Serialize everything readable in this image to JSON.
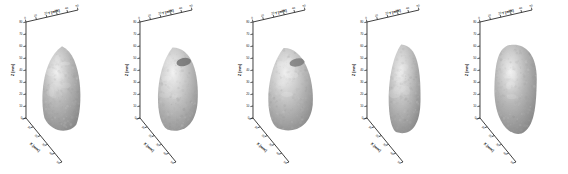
{
  "figure": {
    "background_color": "#ffffff",
    "panel_count": 5
  },
  "axes": {
    "x_title": "X [mm]",
    "y_title": "Y [mm]",
    "z_title": "Z [mm]",
    "x_ticks": [
      "0",
      "10",
      "20",
      "30",
      "40",
      "50"
    ],
    "y_ticks": [
      "0",
      "10",
      "20",
      "30",
      "40",
      "50"
    ],
    "z_ticks": [
      "0",
      "10",
      "20",
      "30",
      "40",
      "50",
      "60",
      "70",
      "80"
    ],
    "tick_color": "#1a1a1a",
    "axis_color": "#2b2b2b"
  },
  "chart_data": {
    "type": "scatter",
    "title": "",
    "xlabel": "X [mm]",
    "ylabel": "Y [mm]",
    "zlabel": "Z [mm]",
    "xlim": [
      0,
      50
    ],
    "ylim": [
      0,
      50
    ],
    "zlim": [
      0,
      80
    ],
    "grid": false,
    "legend": "none",
    "panels": [
      {
        "index": 1,
        "label": "",
        "shape": "elongated-oval",
        "surface_color": "#b8b8b8",
        "highlight_color": "#efefef",
        "shadow_color": "#8a8a8a",
        "notch": false,
        "approx_height_mm": 72,
        "approx_width_mm": 34
      },
      {
        "index": 2,
        "label": "",
        "shape": "rounded-pear",
        "surface_color": "#c2c2c2",
        "highlight_color": "#f2f2f2",
        "shadow_color": "#8f8f8f",
        "notch": true,
        "notch_color": "#6b6b6b",
        "approx_height_mm": 70,
        "approx_width_mm": 36
      },
      {
        "index": 3,
        "label": "",
        "shape": "broad-teardrop",
        "surface_color": "#c0c0c0",
        "highlight_color": "#f0f0f0",
        "shadow_color": "#8c8c8c",
        "notch": true,
        "notch_color": "#777777",
        "approx_height_mm": 69,
        "approx_width_mm": 38
      },
      {
        "index": 4,
        "label": "",
        "shape": "long-cylindrical",
        "surface_color": "#bdbdbd",
        "highlight_color": "#ececec",
        "shadow_color": "#898989",
        "notch": false,
        "approx_height_mm": 75,
        "approx_width_mm": 31
      },
      {
        "index": 5,
        "label": "",
        "shape": "irregular-angular",
        "surface_color": "#b5b5b5",
        "highlight_color": "#efefef",
        "shadow_color": "#868686",
        "notch": false,
        "approx_height_mm": 74,
        "approx_width_mm": 36
      }
    ]
  }
}
